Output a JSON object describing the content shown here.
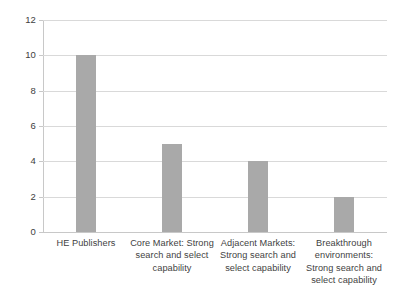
{
  "chart_data": {
    "type": "bar",
    "title": "",
    "subtitle": "",
    "xlabel": "",
    "ylabel": "",
    "categories": [
      "HE Publishers",
      "Core Market: Strong search and select capability",
      "Adjacent Markets: Strong search and select capability",
      "Breakthrough environments: Strong search and select capability"
    ],
    "category_lines": [
      [
        "HE Publishers"
      ],
      [
        "Core Market: Strong",
        "search and select",
        "capability"
      ],
      [
        "Adjacent Markets:",
        "Strong search and",
        "select capability"
      ],
      [
        "Breakthrough",
        "environments:",
        "Strong search and",
        "select capability"
      ]
    ],
    "values": [
      10,
      5,
      4,
      2
    ],
    "series": [
      {
        "name": "Series 1",
        "values": [
          10,
          5,
          4,
          2
        ]
      }
    ],
    "ylim": [
      0,
      12
    ],
    "y_tick_values": [
      0,
      2,
      4,
      6,
      8,
      10,
      12
    ],
    "y_tick_labels": [
      "0",
      "2",
      "4",
      "6",
      "8",
      "10",
      "12"
    ],
    "grid": true,
    "grid_axis": "y",
    "legend": false,
    "legend_position": "none",
    "bar_color": "#a9a9a9",
    "gridline_color": "#d9d9d9",
    "axis_color": "#c8c8c8",
    "background_color": "#ffffff",
    "text_color": "#3f3f3f"
  }
}
